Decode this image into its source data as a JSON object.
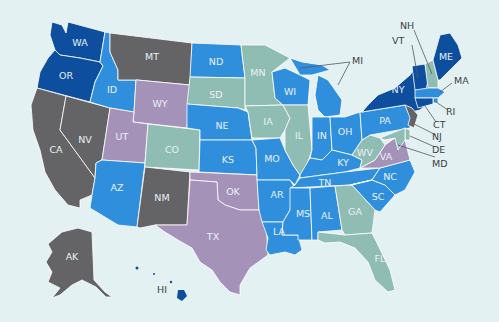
{
  "colors": {
    "background": "#e4f1f3",
    "dark_blue": "#0d4f9e",
    "mid_blue": "#2f8fdc",
    "teal": "#8fbdb3",
    "gray": "#646466",
    "lavender": "#a592b8",
    "label_light": "#e8f1f8",
    "label_dark": "#3b3f45"
  },
  "map": {
    "title": "",
    "states": [
      {
        "abbr": "WA",
        "color": "dark_blue"
      },
      {
        "abbr": "OR",
        "color": "dark_blue"
      },
      {
        "abbr": "CA",
        "color": "gray"
      },
      {
        "abbr": "NV",
        "color": "gray"
      },
      {
        "abbr": "ID",
        "color": "mid_blue"
      },
      {
        "abbr": "MT",
        "color": "gray"
      },
      {
        "abbr": "WY",
        "color": "lavender"
      },
      {
        "abbr": "UT",
        "color": "lavender"
      },
      {
        "abbr": "AZ",
        "color": "mid_blue"
      },
      {
        "abbr": "CO",
        "color": "teal"
      },
      {
        "abbr": "NM",
        "color": "gray"
      },
      {
        "abbr": "ND",
        "color": "mid_blue"
      },
      {
        "abbr": "SD",
        "color": "teal"
      },
      {
        "abbr": "NE",
        "color": "mid_blue"
      },
      {
        "abbr": "KS",
        "color": "mid_blue"
      },
      {
        "abbr": "OK",
        "color": "lavender"
      },
      {
        "abbr": "TX",
        "color": "lavender"
      },
      {
        "abbr": "MN",
        "color": "teal"
      },
      {
        "abbr": "IA",
        "color": "teal"
      },
      {
        "abbr": "MO",
        "color": "mid_blue"
      },
      {
        "abbr": "AR",
        "color": "mid_blue"
      },
      {
        "abbr": "LA",
        "color": "mid_blue"
      },
      {
        "abbr": "WI",
        "color": "mid_blue"
      },
      {
        "abbr": "IL",
        "color": "teal"
      },
      {
        "abbr": "MI",
        "color": "mid_blue"
      },
      {
        "abbr": "IN",
        "color": "mid_blue"
      },
      {
        "abbr": "OH",
        "color": "mid_blue"
      },
      {
        "abbr": "KY",
        "color": "mid_blue"
      },
      {
        "abbr": "TN",
        "color": "mid_blue"
      },
      {
        "abbr": "MS",
        "color": "mid_blue"
      },
      {
        "abbr": "AL",
        "color": "mid_blue"
      },
      {
        "abbr": "GA",
        "color": "teal"
      },
      {
        "abbr": "FL",
        "color": "teal"
      },
      {
        "abbr": "SC",
        "color": "mid_blue"
      },
      {
        "abbr": "NC",
        "color": "mid_blue"
      },
      {
        "abbr": "VA",
        "color": "lavender"
      },
      {
        "abbr": "WV",
        "color": "teal"
      },
      {
        "abbr": "PA",
        "color": "mid_blue"
      },
      {
        "abbr": "NY",
        "color": "dark_blue"
      },
      {
        "abbr": "VT",
        "color": "dark_blue"
      },
      {
        "abbr": "NH",
        "color": "teal"
      },
      {
        "abbr": "ME",
        "color": "dark_blue"
      },
      {
        "abbr": "MA",
        "color": "mid_blue"
      },
      {
        "abbr": "RI",
        "color": "mid_blue"
      },
      {
        "abbr": "CT",
        "color": "dark_blue"
      },
      {
        "abbr": "NJ",
        "color": "gray"
      },
      {
        "abbr": "DE",
        "color": "teal"
      },
      {
        "abbr": "MD",
        "color": "teal"
      },
      {
        "abbr": "AK",
        "color": "gray"
      },
      {
        "abbr": "HI",
        "color": "dark_blue"
      }
    ],
    "labels": {
      "WA": "WA",
      "OR": "OR",
      "CA": "CA",
      "NV": "NV",
      "ID": "ID",
      "MT": "MT",
      "WY": "WY",
      "UT": "UT",
      "AZ": "AZ",
      "CO": "CO",
      "NM": "NM",
      "ND": "ND",
      "SD": "SD",
      "NE": "NE",
      "KS": "KS",
      "OK": "OK",
      "TX": "TX",
      "MN": "MN",
      "IA": "IA",
      "MO": "MO",
      "AR": "AR",
      "LA": "LA",
      "WI": "WI",
      "IL": "IL",
      "MI": "MI",
      "IN": "IN",
      "OH": "OH",
      "KY": "KY",
      "TN": "TN",
      "MS": "MS",
      "AL": "AL",
      "GA": "GA",
      "FL": "FL",
      "SC": "SC",
      "NC": "NC",
      "VA": "VA",
      "WV": "WV",
      "PA": "PA",
      "NY": "NY",
      "VT": "VT",
      "NH": "NH",
      "ME": "ME",
      "MA": "MA",
      "RI": "RI",
      "CT": "CT",
      "NJ": "NJ",
      "DE": "DE",
      "MD": "MD",
      "AK": "AK",
      "HI": "HI"
    }
  }
}
